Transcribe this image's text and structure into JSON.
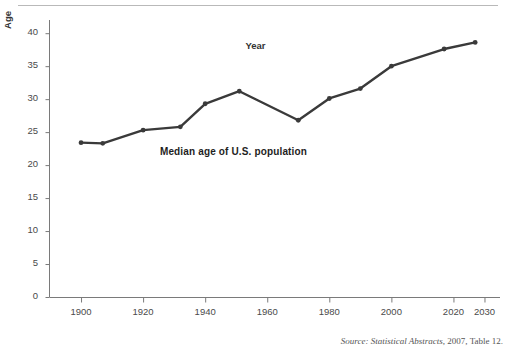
{
  "figure": {
    "top_rule": true,
    "source_note": {
      "prefix": "Source: Statistical Abstracts",
      "suffix": ", 2007, Table 12."
    }
  },
  "chart_data": {
    "type": "line",
    "title": "Median age of U.S. population",
    "xlabel": "Year",
    "ylabel": "Age",
    "xlim": [
      1890,
      2035
    ],
    "ylim": [
      0,
      42
    ],
    "grid": false,
    "legend": null,
    "line_color": "#3a3a3a",
    "marker": "circle",
    "xticks": [
      1900,
      1920,
      1940,
      1960,
      1980,
      2000,
      2020,
      2030
    ],
    "xticklabels": [
      "1900",
      "1920",
      "1940",
      "1960",
      "1980",
      "2000",
      "2020",
      "2030"
    ],
    "yticks": [
      0,
      5,
      10,
      15,
      20,
      25,
      30,
      35,
      40
    ],
    "yticklabels": [
      "0",
      "5",
      "10",
      "15",
      "20",
      "25",
      "30",
      "35",
      "40"
    ],
    "x": [
      1900,
      1907,
      1920,
      1932,
      1940,
      1951,
      1970,
      1980,
      1990,
      2000,
      2017,
      2027
    ],
    "y": [
      23.4,
      23.3,
      25.3,
      25.8,
      29.3,
      31.2,
      26.8,
      30.1,
      31.6,
      35.0,
      37.6,
      38.6
    ],
    "points": [
      {
        "year": 1900,
        "age": 23.4
      },
      {
        "year": 1907,
        "age": 23.3
      },
      {
        "year": 1920,
        "age": 25.3
      },
      {
        "year": 1932,
        "age": 25.8
      },
      {
        "year": 1940,
        "age": 29.3
      },
      {
        "year": 1951,
        "age": 31.2
      },
      {
        "year": 1970,
        "age": 26.8
      },
      {
        "year": 1980,
        "age": 30.1
      },
      {
        "year": 1990,
        "age": 31.6
      },
      {
        "year": 2000,
        "age": 35.0
      },
      {
        "year": 2017,
        "age": 37.6
      },
      {
        "year": 2027,
        "age": 38.6
      }
    ]
  }
}
